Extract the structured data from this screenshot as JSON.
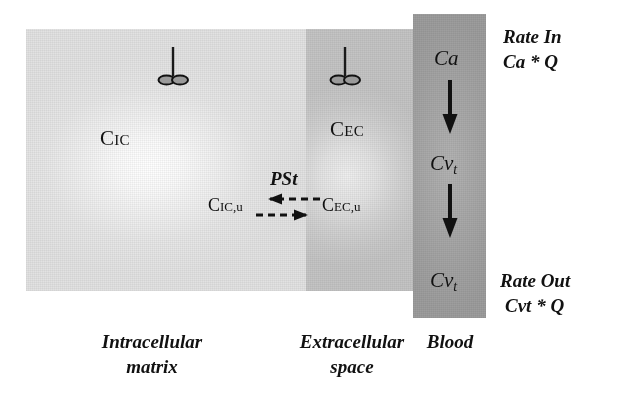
{
  "diagram": {
    "compartments": [
      {
        "id": "intracellular",
        "caption": "Intracellular\nmatrix",
        "concentration_label": "C",
        "concentration_sub": "IC",
        "fill_light": "#ffffff",
        "fill_dark": "#e2e2e2"
      },
      {
        "id": "extracellular",
        "caption": "Extracellular\nspace",
        "concentration_label": "C",
        "concentration_sub": "EC",
        "fill_light": "#efefef",
        "fill_dark": "#c4c4c4"
      },
      {
        "id": "blood",
        "caption": "Blood",
        "fill_light": "#b3b3b3",
        "fill_dark": "#9d9d9d"
      }
    ],
    "unbound": {
      "intracellular_label": "C",
      "intracellular_sub": "IC,u",
      "extracellular_label": "C",
      "extracellular_sub": "EC,u",
      "permeability_label": "PSt"
    },
    "blood_column": {
      "arterial_label": "Ca",
      "venous_mid_label": "Cv",
      "venous_mid_sub": "t",
      "venous_out_label": "Cv",
      "venous_out_sub": "t"
    },
    "rates": {
      "in_title": "Rate In",
      "in_equation": "Ca * Q",
      "out_title": "Rate Out",
      "out_equation": "Cvt * Q"
    },
    "icons": {
      "receptor_name": "bound-receptor-icon",
      "flow_arrow_name": "downward-flow-arrow-icon",
      "exchange_left_name": "dashed-arrow-left-icon",
      "exchange_right_name": "dashed-arrow-right-icon"
    },
    "colors": {
      "ink": "#111111",
      "background": "#ffffff"
    }
  }
}
